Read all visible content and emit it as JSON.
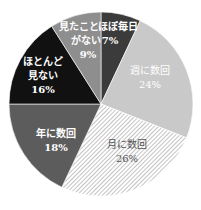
{
  "chart_data": {
    "type": "pie",
    "title": "",
    "start_angle_deg": 0,
    "direction": "clockwise",
    "slices": [
      {
        "label_line1": "ほぼ毎日",
        "label_line2": "",
        "pct_label": "7%",
        "value": 7,
        "color": "#3b3b3b",
        "pattern": "solid",
        "text_color": "#ffffff",
        "bold": true
      },
      {
        "label_line1": "週に数回",
        "label_line2": "",
        "pct_label": "24%",
        "value": 24,
        "color": "#c9c9c9",
        "pattern": "solid",
        "text_color": "#ffffff",
        "bold": false
      },
      {
        "label_line1": "月に数回",
        "label_line2": "",
        "pct_label": "26%",
        "value": 26,
        "color": "#ffffff",
        "pattern": "hatch",
        "text_color": "#555555",
        "bold": false
      },
      {
        "label_line1": "年に数回",
        "label_line2": "",
        "pct_label": "18%",
        "value": 18,
        "color": "#5c5c5c",
        "pattern": "solid",
        "text_color": "#ffffff",
        "bold": true
      },
      {
        "label_line1": "ほとんど",
        "label_line2": "見ない",
        "pct_label": "16%",
        "value": 16,
        "color": "#111111",
        "pattern": "solid",
        "text_color": "#ffffff",
        "bold": true
      },
      {
        "label_line1": "見たことが",
        "label_line2": "ない",
        "pct_label": "9%",
        "value": 9,
        "color": "#8e8e8e",
        "pattern": "solid",
        "text_color": "#ffffff",
        "bold": true
      }
    ],
    "labels": {
      "s0": {
        "l1": "ほぼ毎日",
        "pct": "7%"
      },
      "s1": {
        "l1": "週に数回",
        "pct": "24%"
      },
      "s2": {
        "l1": "月に数回",
        "pct": "26%"
      },
      "s3": {
        "l1": "年に数回",
        "pct": "18%"
      },
      "s4": {
        "l1": "ほとんど",
        "l2": "見ない",
        "pct": "16%"
      },
      "s5": {
        "l1": "見たこと",
        "l2": "がない",
        "pct": "9%"
      }
    }
  }
}
